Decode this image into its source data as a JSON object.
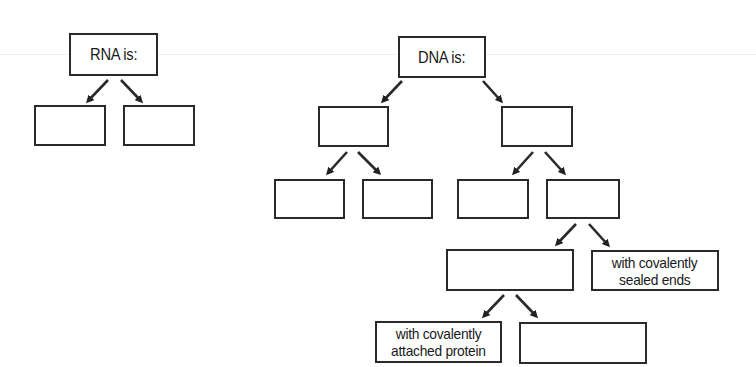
{
  "diagram": {
    "rna": {
      "root": {
        "label": "RNA is:"
      },
      "children": [
        {
          "label": ""
        },
        {
          "label": ""
        }
      ]
    },
    "dna": {
      "root": {
        "label": "DNA is:"
      },
      "level2": [
        {
          "label": ""
        },
        {
          "label": ""
        }
      ],
      "level3": [
        {
          "label": ""
        },
        {
          "label": ""
        },
        {
          "label": ""
        },
        {
          "label": ""
        }
      ],
      "level4": [
        {
          "label": ""
        },
        {
          "label_line1": "with covalently",
          "label_line2": "sealed ends"
        }
      ],
      "level5": [
        {
          "label_line1": "with covalently",
          "label_line2": "attached protein"
        },
        {
          "label": ""
        }
      ]
    },
    "arrows": [
      {
        "from": [
          108,
          80
        ],
        "to": [
          88,
          101
        ]
      },
      {
        "from": [
          121,
          80
        ],
        "to": [
          141,
          101
        ]
      },
      {
        "from": [
          402,
          81
        ],
        "to": [
          383,
          101
        ]
      },
      {
        "from": [
          483,
          81
        ],
        "to": [
          501,
          101
        ]
      },
      {
        "from": [
          347,
          152
        ],
        "to": [
          328,
          173
        ]
      },
      {
        "from": [
          358,
          152
        ],
        "to": [
          379,
          173
        ]
      },
      {
        "from": [
          533,
          152
        ],
        "to": [
          514,
          173
        ]
      },
      {
        "from": [
          545,
          152
        ],
        "to": [
          564,
          173
        ]
      },
      {
        "from": [
          576,
          224
        ],
        "to": [
          557,
          244
        ]
      },
      {
        "from": [
          589,
          224
        ],
        "to": [
          608,
          245
        ]
      },
      {
        "from": [
          504,
          295
        ],
        "to": [
          484,
          316
        ]
      },
      {
        "from": [
          516,
          295
        ],
        "to": [
          536,
          316
        ]
      }
    ],
    "colors": {
      "stroke": "#2a2a2a",
      "background": "#ffffff"
    }
  }
}
